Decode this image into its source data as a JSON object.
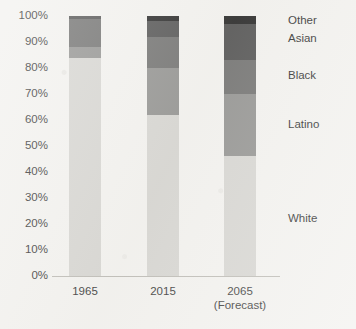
{
  "chart_data": {
    "type": "bar",
    "subtype": "stacked-percent",
    "title": "",
    "xlabel": "",
    "ylabel": "",
    "categories": [
      "1965",
      "2015",
      "2065"
    ],
    "category_sublabels": [
      "",
      "",
      "(Forecast)"
    ],
    "series": [
      {
        "name": "White",
        "values": [
          84,
          62,
          46
        ],
        "color": "#d4d3cf"
      },
      {
        "name": "Latino",
        "values": [
          4,
          18,
          24
        ],
        "color": "#8d8d8b"
      },
      {
        "name": "Black",
        "values": [
          11,
          12,
          13
        ],
        "color": "#6a6a69"
      },
      {
        "name": "Asian",
        "values": [
          1,
          6,
          14
        ],
        "color": "#4a4a4a"
      },
      {
        "name": "Other",
        "values": [
          0,
          2,
          3
        ],
        "color": "#1c1c1c"
      }
    ],
    "stack_order_bottom_to_top": [
      "White",
      "Latino",
      "Black",
      "Asian",
      "Other"
    ],
    "ylim": [
      0,
      100
    ],
    "ytick_labels": [
      "100%",
      "90%",
      "80%",
      "70%",
      "60%",
      "50%",
      "40%",
      "30%",
      "20%",
      "10%",
      "0%"
    ],
    "ytick_values": [
      100,
      90,
      80,
      70,
      60,
      50,
      40,
      30,
      20,
      10,
      0
    ],
    "grid": false,
    "legend_position": "right-inline",
    "legend_entries": [
      {
        "label": "Other",
        "at_percent": 98
      },
      {
        "label": "Asian",
        "at_percent": 91
      },
      {
        "label": "Black",
        "at_percent": 77
      },
      {
        "label": "Latino",
        "at_percent": 58
      },
      {
        "label": "White",
        "at_percent": 22
      }
    ],
    "axis_line_color": "#b9b7b1",
    "background_color": "#f2f1ee"
  }
}
